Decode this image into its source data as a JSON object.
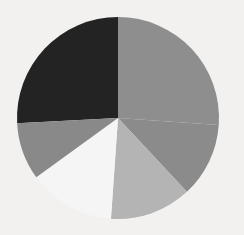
{
  "background_color": "#f2f1ef",
  "chart_data": {
    "type": "pie",
    "title": "",
    "subtitle": "",
    "xlabel": "",
    "ylabel": "",
    "legend": "none",
    "grid": false,
    "start_angle_deg": -93,
    "direction": "clockwise",
    "center": {
      "x": 118,
      "y": 118
    },
    "radius": 101,
    "categories": [
      "Slice 1",
      "Slice 2",
      "Slice 3",
      "Slice 4",
      "Slice 5",
      "Slice 6"
    ],
    "values": [
      26,
      25,
      12,
      13,
      14,
      10
    ],
    "units": "percent",
    "colors": [
      "#232323",
      "#8e8e8e",
      "#8b8b8b",
      "#b4b4b4",
      "#f5f5f5",
      "#898989"
    ],
    "slices": [
      {
        "label": "Slice 1",
        "value": 26,
        "color": "#232323",
        "start_deg": -93,
        "end_deg": 0
      },
      {
        "label": "Slice 2",
        "value": 25,
        "color": "#8e8e8e",
        "start_deg": 0,
        "end_deg": 94
      },
      {
        "label": "Slice 3",
        "value": 12,
        "color": "#8b8b8b",
        "start_deg": 94,
        "end_deg": 137
      },
      {
        "label": "Slice 4",
        "value": 13,
        "color": "#b4b4b4",
        "start_deg": 137,
        "end_deg": 184
      },
      {
        "label": "Slice 5",
        "value": 14,
        "color": "#f5f5f5",
        "start_deg": 184,
        "end_deg": 234
      },
      {
        "label": "Slice 6",
        "value": 10,
        "color": "#898989",
        "start_deg": 234,
        "end_deg": 267
      }
    ]
  }
}
